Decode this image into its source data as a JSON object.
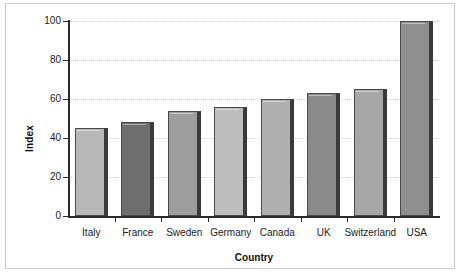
{
  "chart_data": {
    "type": "bar",
    "title": "",
    "xlabel": "Country",
    "ylabel": "Index",
    "categories": [
      "Italy",
      "France",
      "Sweden",
      "Germany",
      "Canada",
      "UK",
      "Switzerland",
      "USA"
    ],
    "values": [
      45,
      48,
      54,
      56,
      60,
      63,
      65,
      100
    ],
    "ylim": [
      0,
      100
    ],
    "yticks": [
      0,
      20,
      40,
      60,
      80,
      100
    ],
    "ytick_labels": [
      "0",
      "20",
      "40",
      "60",
      "80",
      "100"
    ],
    "grid": true,
    "legend": "none",
    "bar_colors": [
      "#b8b8b8",
      "#6e6e6e",
      "#9d9d9d",
      "#bdbdbd",
      "#b0b0b0",
      "#8a8a8a",
      "#a6a6a6",
      "#8f8f8f"
    ],
    "bar_edge_color": "#4a4a4a",
    "axis_color": "#2b2b2b",
    "grid_color": "#d2d2d2",
    "frame_color": "#c9c9c9",
    "background_color": "#ffffff"
  }
}
